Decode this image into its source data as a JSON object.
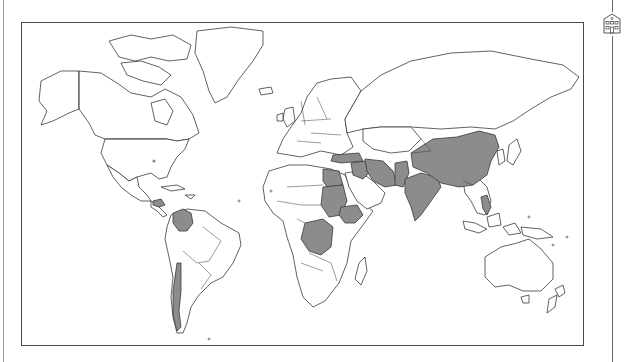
{
  "map": {
    "type": "choropleth world map",
    "projection": "mercator",
    "land_fill": "#ffffff",
    "border_color": "#3a3a3a",
    "highlight_fill": "#8c8c8c",
    "frame_color": "#4a4a4a",
    "highlighted_countries": [
      "Guatemala",
      "Honduras",
      "Colombia",
      "Chile",
      "Egypt",
      "Sudan",
      "South Sudan",
      "Ethiopia",
      "Democratic Republic of the Congo",
      "Turkey",
      "Syria",
      "Iraq",
      "Iran",
      "Pakistan",
      "India",
      "China",
      "Philippines"
    ],
    "markers": [
      {
        "name": "dot-usa",
        "approx_location": "central United States"
      }
    ]
  },
  "side_panel": {
    "icon": "building-icon"
  }
}
